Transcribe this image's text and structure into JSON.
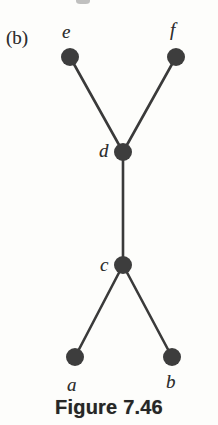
{
  "figure": {
    "panel_label": "(b)",
    "caption": "Figure 7.46",
    "background_color": "#fdfdfb",
    "ink_color": "#3a3a3a",
    "node_color": "#3d3d3d",
    "label_color": "#2f2f2f"
  },
  "chart_data": {
    "type": "diagram",
    "title": "Figure 7.46",
    "subtitle": "(b)",
    "graph_kind": "tree",
    "node_radius": 9,
    "edge_width": 2.6,
    "nodes": [
      {
        "id": "e",
        "label": "e",
        "x": 70,
        "y": 57,
        "label_x": 62,
        "label_y": 22
      },
      {
        "id": "f",
        "label": "f",
        "x": 176,
        "y": 57,
        "label_x": 170,
        "label_y": 20
      },
      {
        "id": "d",
        "label": "d",
        "x": 123,
        "y": 152,
        "label_x": 99,
        "label_y": 141
      },
      {
        "id": "c",
        "label": "c",
        "x": 123,
        "y": 265,
        "label_x": 100,
        "label_y": 255
      },
      {
        "id": "a",
        "label": "a",
        "x": 75,
        "y": 357,
        "label_x": 67,
        "label_y": 375
      },
      {
        "id": "b",
        "label": "b",
        "x": 172,
        "y": 357,
        "label_x": 166,
        "label_y": 372
      }
    ],
    "edges": [
      {
        "from": "e",
        "to": "d"
      },
      {
        "from": "f",
        "to": "d"
      },
      {
        "from": "d",
        "to": "c"
      },
      {
        "from": "c",
        "to": "a"
      },
      {
        "from": "c",
        "to": "b"
      }
    ],
    "xlabel": "",
    "ylabel": "",
    "legend": []
  }
}
